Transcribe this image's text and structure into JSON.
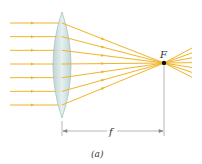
{
  "diagram": {
    "type": "converging-lens",
    "focal_point_label": "F",
    "focal_length_label": "f",
    "caption": "(a)",
    "ray_count": 7,
    "colors": {
      "ray": "#f0b428",
      "lens_fill": "#c8dcdc",
      "lens_stroke": "#8fb0b0",
      "focal_point": "#111111",
      "dimension_line": "#888888"
    }
  }
}
